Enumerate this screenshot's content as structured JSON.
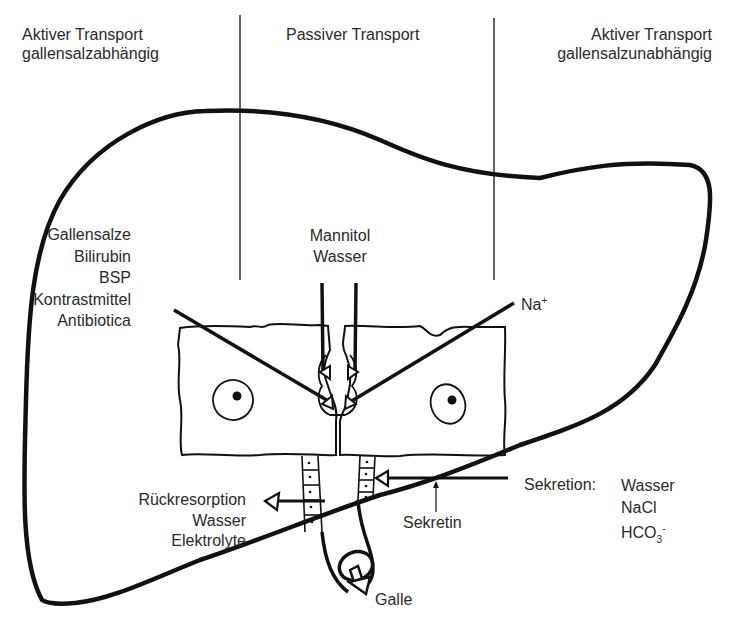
{
  "columns": {
    "left": {
      "line1": "Aktiver Transport",
      "line2": "gallensalzabhängig"
    },
    "middle": {
      "line1": "Passiver Transport"
    },
    "right": {
      "line1": "Aktiver Transport",
      "line2": "gallensalzunabhängig"
    }
  },
  "left_substances": [
    "Gallensalze",
    "Bilirubin",
    "BSP",
    "Kontrastmittel",
    "Antibiotica"
  ],
  "middle_substances": [
    "Mannitol",
    "Wasser"
  ],
  "right_substance": {
    "base": "Na",
    "charge": "+"
  },
  "reabsorption": [
    "Rückresorption",
    "Wasser",
    "Elektrolyte"
  ],
  "secretion": {
    "label": "Sekretion:",
    "items": [
      "Wasser",
      "NaCl"
    ],
    "bicarbonate": {
      "base": "HCO",
      "sub": "3",
      "charge": "-"
    }
  },
  "stimulus": "Sekretin",
  "output": "Galle",
  "colors": {
    "ink": "#111111",
    "text": "#2a2a2a",
    "background": "#ffffff"
  }
}
